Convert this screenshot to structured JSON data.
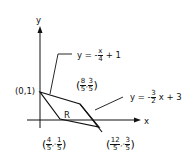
{
  "figure": {
    "axes": {
      "x_label": "x",
      "y_label": "y"
    },
    "region_label": "R",
    "lines": [
      {
        "name": "upper-line",
        "eq_prefix": "y = -",
        "eq_frac_num": "x",
        "eq_frac_den": "4",
        "eq_suffix": "+ 1"
      },
      {
        "name": "right-line",
        "eq_prefix": "y = -",
        "eq_frac_num": "3",
        "eq_frac_den": "2",
        "eq_suffix": "x + 3"
      }
    ],
    "vertices": [
      {
        "name": "vertex-0-1",
        "text": "(0,1)"
      },
      {
        "name": "vertex-8-5-3-5",
        "x_num": "8",
        "x_den": "5",
        "y_num": "3",
        "y_den": "5"
      },
      {
        "name": "vertex-4-5-neg1-5",
        "x_num": "4",
        "x_den": "5",
        "y_sign": "-",
        "y_num": "1",
        "y_den": "5"
      },
      {
        "name": "vertex-12-5-neg3-5",
        "x_num": "12",
        "x_den": "5",
        "y_sign": "-",
        "y_num": "3",
        "y_den": "5"
      }
    ]
  }
}
